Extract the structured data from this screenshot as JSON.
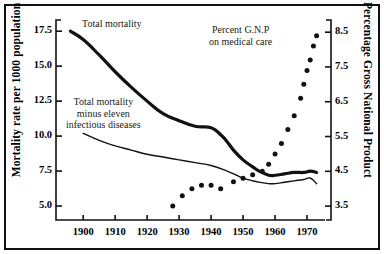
{
  "figure": {
    "frame": true,
    "background": "#ffffff",
    "ink": "#000000"
  },
  "chart_data": {
    "type": "line",
    "title": "",
    "subtitle": "",
    "xlabel": "",
    "ylabel": "Mortality rate per 1000 population",
    "ylabel_right": "Percentage Gross National Product",
    "xlim": [
      1894,
      1975
    ],
    "ylim": [
      4.0,
      18.3
    ],
    "ylim_right": [
      3.1,
      8.85
    ],
    "xticks": [
      1900,
      1910,
      1920,
      1930,
      1940,
      1950,
      1960,
      1970
    ],
    "xticklabels": [
      "1900",
      "1910",
      "1920",
      "1930",
      "1940",
      "1950",
      "1960",
      "1970"
    ],
    "yticks": [
      5.0,
      7.5,
      10.0,
      12.5,
      15.0,
      17.5
    ],
    "yticklabels": [
      "5.0",
      "7.5",
      "10.0",
      "12.5",
      "15.0",
      "17.5"
    ],
    "yticks_right": [
      3.5,
      4.5,
      5.5,
      6.5,
      7.5,
      8.5
    ],
    "yticklabels_right": [
      "3.5",
      "4.5",
      "5.5",
      "6.5",
      "7.5",
      "8.5"
    ],
    "grid": false,
    "legend": "inline-annotations",
    "series": [
      {
        "name": "Total mortality",
        "axis": "left",
        "style": "thick-line",
        "color": "#111111",
        "x": [
          1896,
          1900,
          1905,
          1910,
          1915,
          1920,
          1925,
          1930,
          1935,
          1940,
          1943,
          1945,
          1947,
          1950,
          1953,
          1955,
          1958,
          1960,
          1963,
          1966,
          1969,
          1971,
          1973
        ],
        "y": [
          17.5,
          16.9,
          15.8,
          14.6,
          13.5,
          12.5,
          11.6,
          11.1,
          10.7,
          10.6,
          10.1,
          9.6,
          9.0,
          8.3,
          7.8,
          7.5,
          7.2,
          7.2,
          7.3,
          7.4,
          7.4,
          7.5,
          7.4
        ]
      },
      {
        "name": "Total mortality minus eleven infectious diseases",
        "axis": "left",
        "style": "thin-line",
        "color": "#111111",
        "x": [
          1900,
          1905,
          1910,
          1915,
          1920,
          1925,
          1930,
          1935,
          1940,
          1945,
          1948,
          1950,
          1953,
          1955,
          1958,
          1960,
          1963,
          1966,
          1969,
          1971,
          1973
        ],
        "y": [
          10.2,
          9.7,
          9.3,
          9.0,
          8.7,
          8.5,
          8.3,
          8.1,
          7.9,
          7.5,
          7.2,
          7.0,
          6.8,
          6.7,
          6.6,
          6.6,
          6.7,
          6.8,
          6.9,
          7.0,
          6.6
        ]
      },
      {
        "name": "Percent G.N.P on medical care",
        "axis": "right",
        "style": "dotted",
        "color": "#111111",
        "x": [
          1928,
          1931,
          1934,
          1937,
          1940,
          1943,
          1947,
          1950,
          1953,
          1956,
          1958,
          1960,
          1962,
          1964,
          1966,
          1968,
          1969,
          1970,
          1971,
          1972,
          1973
        ],
        "y": [
          3.5,
          3.8,
          4.0,
          4.1,
          4.1,
          4.0,
          4.2,
          4.3,
          4.4,
          4.5,
          4.7,
          5.0,
          5.3,
          5.7,
          6.1,
          6.6,
          7.0,
          7.4,
          7.7,
          8.1,
          8.4
        ]
      }
    ],
    "annotations": [
      {
        "id": "total-mortality",
        "text_lines": [
          "Total mortality"
        ],
        "x_px": 82,
        "y_px": 18
      },
      {
        "id": "total-mortality-minus",
        "text_lines": [
          "Total mortality",
          "minus eleven",
          "infectious diseases"
        ],
        "x_px": 66,
        "y_px": 96
      },
      {
        "id": "percent-gnp",
        "text_lines": [
          "Percent G.N.P",
          "on medical care"
        ],
        "x_px": 209,
        "y_px": 24
      }
    ]
  }
}
